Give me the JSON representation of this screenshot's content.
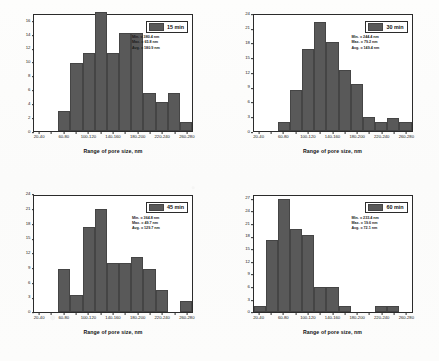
{
  "figure": {
    "background": "#ffffff",
    "bar_color": "#595959",
    "axis_color": "#2b2b2b"
  },
  "common": {
    "xlabel": "Range of pore size, nm",
    "ylabel": "%, Pore size distribution",
    "bins": [
      "20-40",
      "40-60",
      "60-80",
      "80-100",
      "100-120",
      "120-140",
      "140-160",
      "160-180",
      "180-200",
      "200-220",
      "220-240",
      "240-260",
      "260-280"
    ],
    "xtick_labels": [
      "20-40",
      "60-80",
      "100-120",
      "140-160",
      "180-200",
      "220-240",
      "260-280"
    ],
    "stat_labels": {
      "min": "Min.",
      "max": "Max.",
      "avg": "Avg.",
      "unit": "nm"
    }
  },
  "chart_data": [
    {
      "type": "bar",
      "id": "panel-15min",
      "title": "15 min",
      "xlabel": "Range of pore size, nm",
      "ylabel": "%, Pore size distribution",
      "categories": [
        "20-40",
        "40-60",
        "60-80",
        "80-100",
        "100-120",
        "120-140",
        "140-160",
        "160-180",
        "180-200",
        "200-220",
        "220-240",
        "240-260",
        "260-280"
      ],
      "values": [
        0,
        0,
        2.9,
        10.0,
        11.4,
        17.5,
        11.4,
        14.3,
        14.3,
        5.6,
        4.2,
        5.6,
        1.3
      ],
      "ylim": [
        0,
        17
      ],
      "yticks": [
        0,
        2,
        4,
        6,
        8,
        10,
        12,
        14,
        16
      ],
      "grid": false,
      "legend_position": "top-right",
      "stats": {
        "min": "380.4",
        "max": "65.8",
        "avg": "180.9"
      },
      "stat_lines": [
        "Min. = 380.4 nm",
        "Max. = 65.8 nm",
        "Avg. = 180.9 nm"
      ]
    },
    {
      "type": "bar",
      "id": "panel-30min",
      "title": "30 min",
      "xlabel": "Range of pore size, nm",
      "ylabel": "%, Pore size distribution",
      "categories": [
        "20-40",
        "40-60",
        "60-80",
        "80-100",
        "100-120",
        "120-140",
        "140-160",
        "160-180",
        "180-200",
        "200-220",
        "220-240",
        "240-260",
        "260-280"
      ],
      "values": [
        0,
        0,
        1.9,
        8.5,
        17.0,
        22.6,
        18.4,
        12.7,
        9.7,
        2.8,
        1.8,
        2.7,
        1.8
      ],
      "ylim": [
        0,
        24
      ],
      "yticks": [
        0,
        3,
        6,
        9,
        12,
        15,
        18,
        21,
        24
      ],
      "grid": false,
      "legend_position": "top-right",
      "stats": {
        "min": "244.4",
        "max": "79.2",
        "avg": "149.4"
      },
      "stat_lines": [
        "Min. = 244.4 nm",
        "Max. = 79.2 nm",
        "Avg. = 149.4 nm"
      ]
    },
    {
      "type": "bar",
      "id": "panel-45min",
      "title": "45 min",
      "xlabel": "Range of pore size, nm",
      "ylabel": "%, Pore size distribution",
      "categories": [
        "20-40",
        "40-60",
        "60-80",
        "80-100",
        "100-120",
        "120-140",
        "140-160",
        "160-180",
        "180-200",
        "200-220",
        "220-240",
        "240-260",
        "260-280"
      ],
      "values": [
        0,
        0,
        8.7,
        3.5,
        17.4,
        21.3,
        10.0,
        10.0,
        11.3,
        8.7,
        4.5,
        0,
        2.2
      ],
      "ylim": [
        0,
        24
      ],
      "yticks": [
        0,
        3,
        6,
        9,
        12,
        15,
        18,
        21,
        24
      ],
      "grid": false,
      "legend_position": "top-right",
      "stats": {
        "min": "364.8",
        "max": "49.7",
        "avg": "129.7"
      },
      "stat_lines": [
        "Min. = 364.8 nm",
        "Max. = 49.7 nm",
        "Avg. = 129.7 nm"
      ]
    },
    {
      "type": "bar",
      "id": "panel-60min",
      "title": "60 min",
      "xlabel": "Range of pore size, nm",
      "ylabel": "%, Pore size distribution",
      "categories": [
        "20-40",
        "40-60",
        "60-80",
        "80-100",
        "100-120",
        "120-140",
        "140-160",
        "160-180",
        "180-200",
        "200-220",
        "220-240",
        "240-260",
        "260-280"
      ],
      "values": [
        1.4,
        17.2,
        27.2,
        19.8,
        18.5,
        6.0,
        6.0,
        1.4,
        0,
        0,
        1.4,
        1.4,
        0
      ],
      "ylim": [
        0,
        28
      ],
      "yticks": [
        0,
        3,
        6,
        9,
        12,
        15,
        18,
        21,
        24,
        27
      ],
      "grid": false,
      "legend_position": "top-right",
      "stats": {
        "min": "233.4",
        "max": "19.6",
        "avg": "72.1"
      },
      "stat_lines": [
        "Min. = 233.4 nm",
        "Max. = 19.6 nm",
        "Avg. = 72.1 nm"
      ]
    }
  ]
}
